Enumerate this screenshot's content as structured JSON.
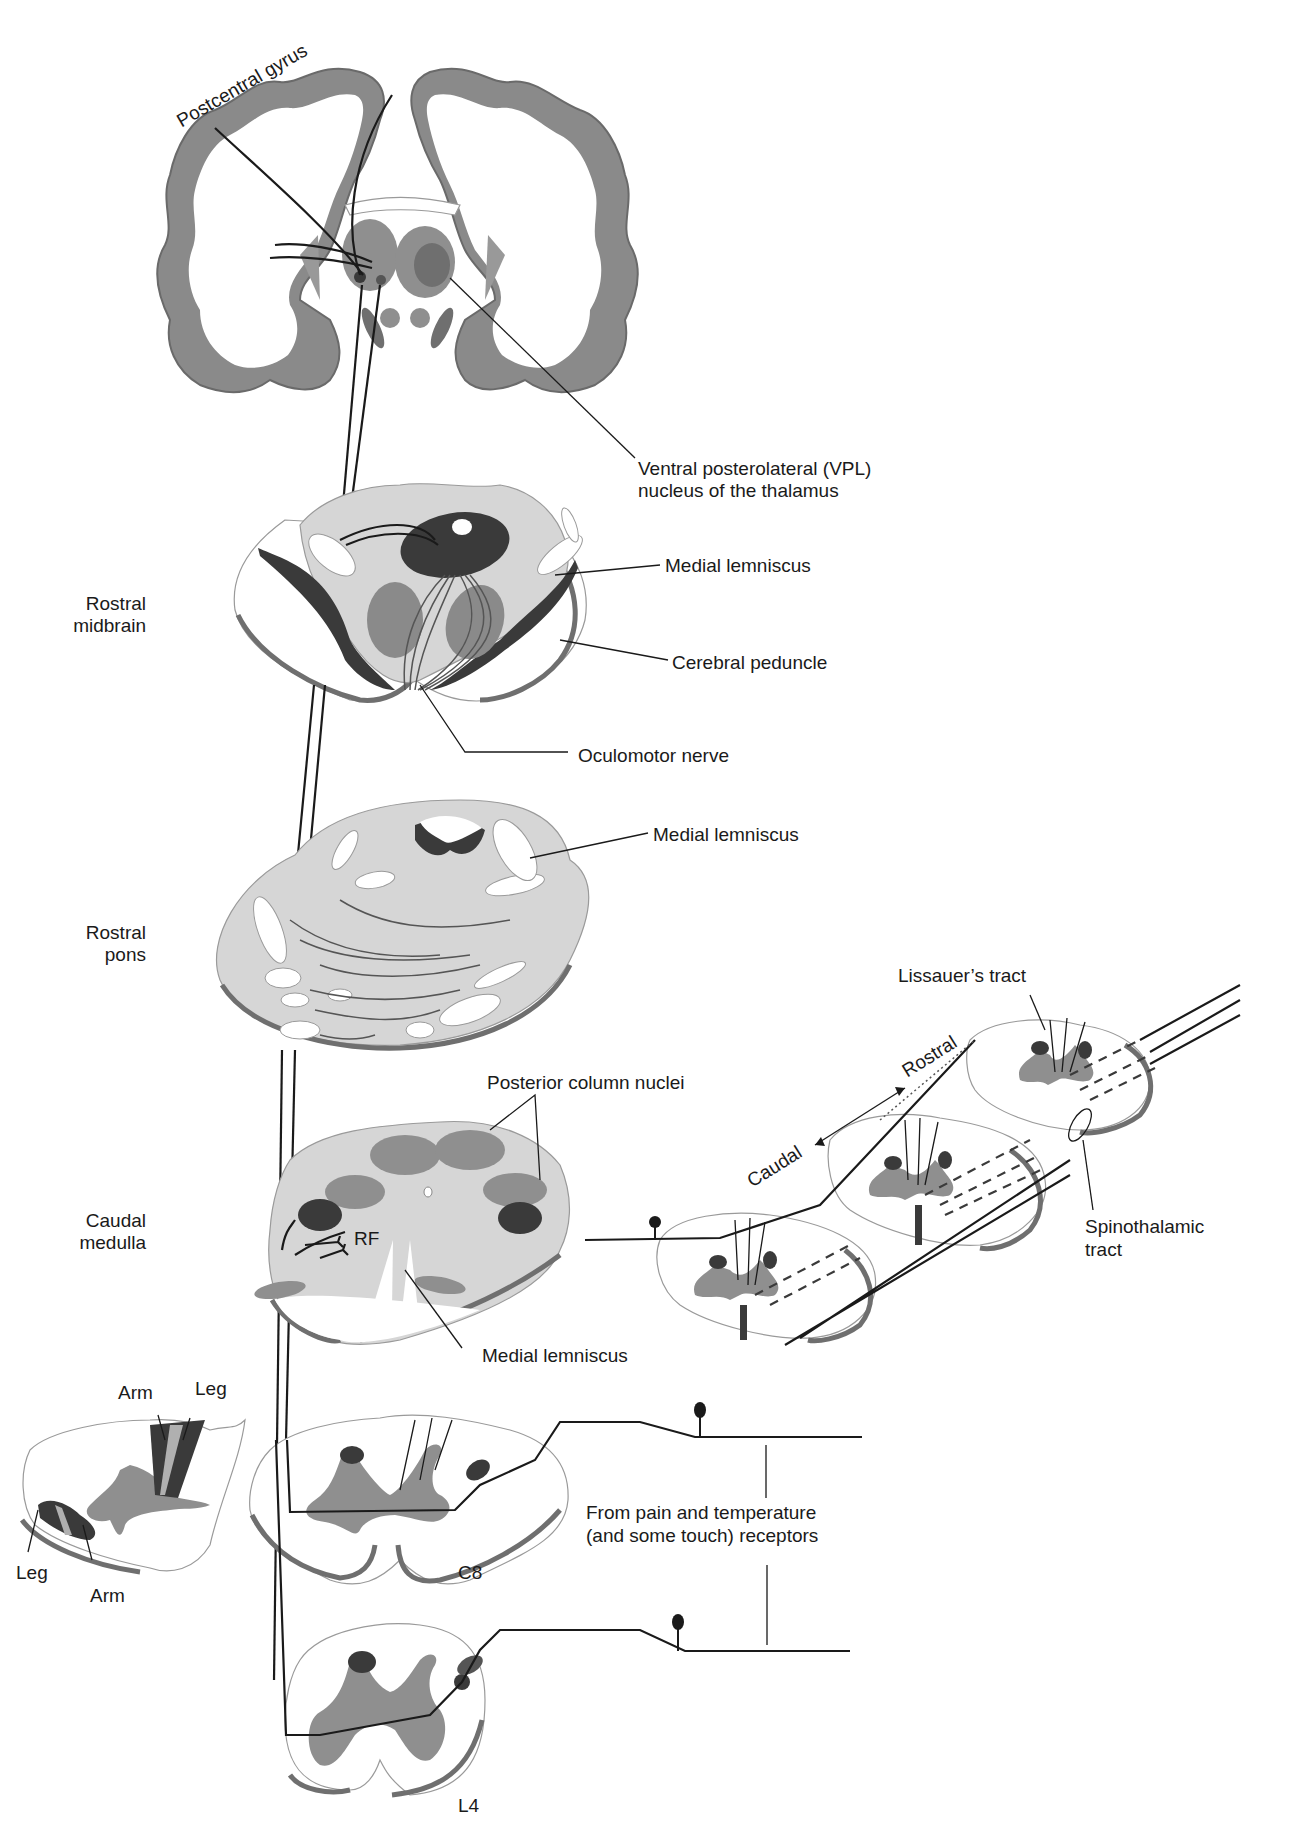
{
  "figure": {
    "colors": {
      "cortex_gray": "#8a8a8a",
      "cortex_shadow": "#6a6a6a",
      "tissue_light": "#d6d6d6",
      "nucleus_dark": "#3a3a3a",
      "gray_matter": "#8f8f8f",
      "line": "#1a1a1a",
      "background": "#ffffff"
    }
  },
  "labels": {
    "postcentral_gyrus": "Postcentral gyrus",
    "vpl_line1": "Ventral posterolateral (VPL)",
    "vpl_line2": "nucleus of the thalamus",
    "medial_lemniscus_midbrain": "Medial lemniscus",
    "cerebral_peduncle": "Cerebral peduncle",
    "oculomotor_nerve": "Oculomotor nerve",
    "medial_lemniscus_pons": "Medial lemniscus",
    "posterior_column_nuclei": "Posterior column nuclei",
    "rf": "RF",
    "medial_lemniscus_medulla": "Medial lemniscus",
    "lissauers_tract": "Lissauer’s tract",
    "rostral_arrow": "Rostral",
    "caudal_arrow": "Caudal",
    "spinothalamic_line1": "Spinothalamic",
    "spinothalamic_line2": "tract",
    "receptors_line1": "From pain and temperature",
    "receptors_line2": "(and some touch) receptors",
    "c8": "C8",
    "l4": "L4",
    "inset_arm_top": "Arm",
    "inset_leg_top": "Leg",
    "inset_leg_bottom": "Leg",
    "inset_arm_bottom": "Arm"
  },
  "levels": [
    {
      "line1": "Rostral",
      "line2": "midbrain"
    },
    {
      "line1": "Rostral",
      "line2": "pons"
    },
    {
      "line1": "Caudal",
      "line2": "medulla"
    }
  ]
}
